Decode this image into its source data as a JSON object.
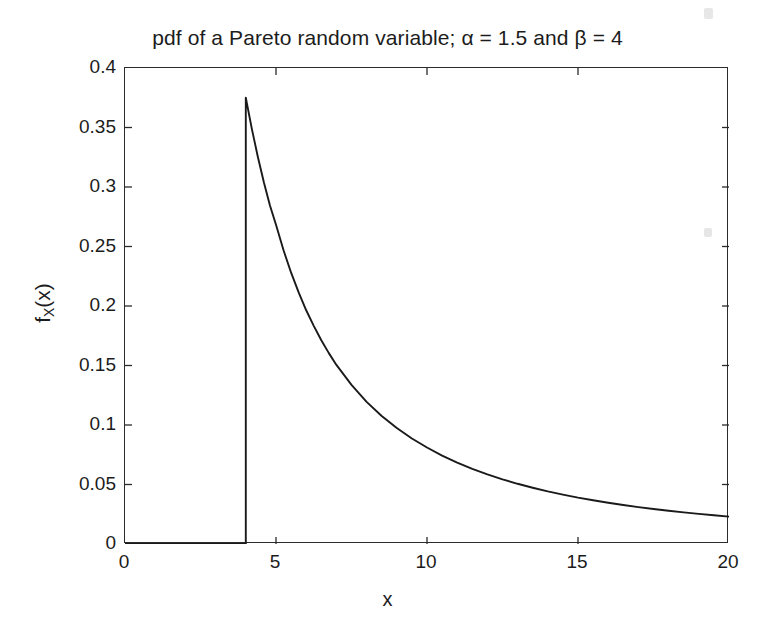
{
  "figure": {
    "width": 775,
    "height": 625,
    "background": "#ffffff",
    "foreground": "#1c1c1c"
  },
  "chart_data": {
    "type": "line",
    "title": "pdf of a Pareto random variable; α = 1.5 and β = 4",
    "xlabel": "x",
    "ylabel": "f_X(x)",
    "ylabel_main": "f",
    "ylabel_sub": "X",
    "ylabel_arg": "(x)",
    "xlim": [
      0,
      20
    ],
    "ylim": [
      0,
      0.4
    ],
    "grid": false,
    "legend": null,
    "line_color": "#1a1a1a",
    "line_width": 1.9,
    "xticks": [
      0,
      5,
      10,
      15,
      20
    ],
    "xtick_labels": [
      "0",
      "5",
      "10",
      "15",
      "20"
    ],
    "yticks": [
      0,
      0.05,
      0.1,
      0.15,
      0.2,
      0.25,
      0.3,
      0.35,
      0.4
    ],
    "ytick_labels": [
      "0",
      "0.05",
      "0.1",
      "0.15",
      "0.2",
      "0.25",
      "0.3",
      "0.35",
      "0.4"
    ],
    "distribution": "Pareto",
    "parameters": {
      "alpha": 1.5,
      "beta": 4
    },
    "formula": "f(x) = alpha * beta^alpha / x^(alpha+1), x >= beta",
    "peak": {
      "x": 4,
      "y": 0.375
    },
    "series": [
      {
        "name": "pdf",
        "x": [
          0,
          1,
          2,
          3,
          4,
          4,
          4.2,
          4.4,
          4.6,
          4.8,
          5,
          5.25,
          5.5,
          5.75,
          6,
          6.25,
          6.5,
          6.75,
          7,
          7.5,
          8,
          8.5,
          9,
          9.5,
          10,
          10.5,
          11,
          11.5,
          12,
          12.5,
          13,
          13.5,
          14,
          14.5,
          15,
          15.5,
          16,
          16.5,
          17,
          17.5,
          18,
          18.5,
          19,
          19.5,
          20
        ],
        "y": [
          0,
          0,
          0,
          0,
          0,
          0.375,
          0.3488,
          0.3252,
          0.3038,
          0.2844,
          0.2683,
          0.2468,
          0.228,
          0.2114,
          0.1964,
          0.1833,
          0.1712,
          0.1604,
          0.1505,
          0.1337,
          0.1194,
          0.1076,
          0.0975,
          0.0887,
          0.0811,
          0.0743,
          0.0684,
          0.0632,
          0.0585,
          0.0543,
          0.0506,
          0.0473,
          0.0442,
          0.0415,
          0.039,
          0.0368,
          0.0347,
          0.0328,
          0.031,
          0.0294,
          0.0279,
          0.0266,
          0.0253,
          0.0241,
          0.023
        ]
      }
    ]
  }
}
